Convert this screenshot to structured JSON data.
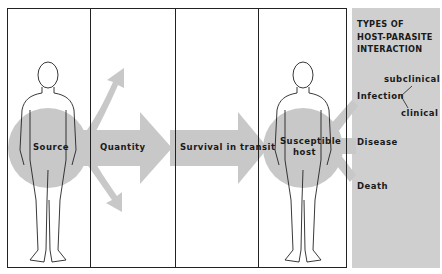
{
  "title": {
    "lines": [
      "TYPES OF",
      "HOST-PARASITE",
      "INTERACTION"
    ]
  },
  "panels": [
    {
      "label": "Source"
    },
    {
      "label": "Quantity"
    },
    {
      "label": "Survival in transit"
    },
    {
      "label": "Susceptible",
      "label2": "host"
    }
  ],
  "outcomes": {
    "infection": "Infection",
    "subclinical": "subclinical",
    "clinical": "clinical",
    "disease": "Disease",
    "death": "Death"
  },
  "colors": {
    "arrow_gray": "#c8c8c8",
    "sidebar_gray": "#cfcfcf",
    "line": "#222222"
  }
}
